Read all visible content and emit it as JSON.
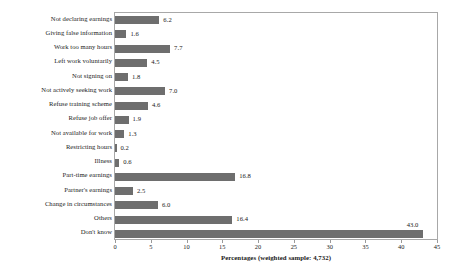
{
  "chart_data": {
    "type": "bar",
    "orientation": "horizontal",
    "title": "",
    "xlabel": "Percentages (weighted sample: 4,732)",
    "ylabel": "Factors restricting benefit",
    "xlim": [
      0,
      45
    ],
    "xticks": [
      0,
      5,
      10,
      15,
      20,
      25,
      30,
      35,
      40,
      45
    ],
    "grid": false,
    "legend": false,
    "bar_color": "#6e6e6e",
    "frame_color": "#a8a8a8",
    "categories": [
      "Not declaring earnings",
      "Giving false information",
      "Work too many hours",
      "Left work voluntarily",
      "Not signing on",
      "Not actively seeking work",
      "Refuse training scheme",
      "Refuse job offer",
      "Not available for work",
      "Restricting hours",
      "Illness",
      "Part-time earnings",
      "Partner's earnings",
      "Change in circumstances",
      "Others",
      "Don't know"
    ],
    "values": [
      6.2,
      1.6,
      7.7,
      4.5,
      1.8,
      7.0,
      4.6,
      1.9,
      1.3,
      0.2,
      0.6,
      16.8,
      2.5,
      6.0,
      16.4,
      43.0
    ],
    "value_labels": [
      "6.2",
      "1.6",
      "7.7",
      "4.5",
      "1.8",
      "7.0",
      "4.6",
      "1.9",
      "1.3",
      "0.2",
      "0.6",
      "16.8",
      "2.5",
      "6.0",
      "16.4",
      "43.0"
    ]
  }
}
